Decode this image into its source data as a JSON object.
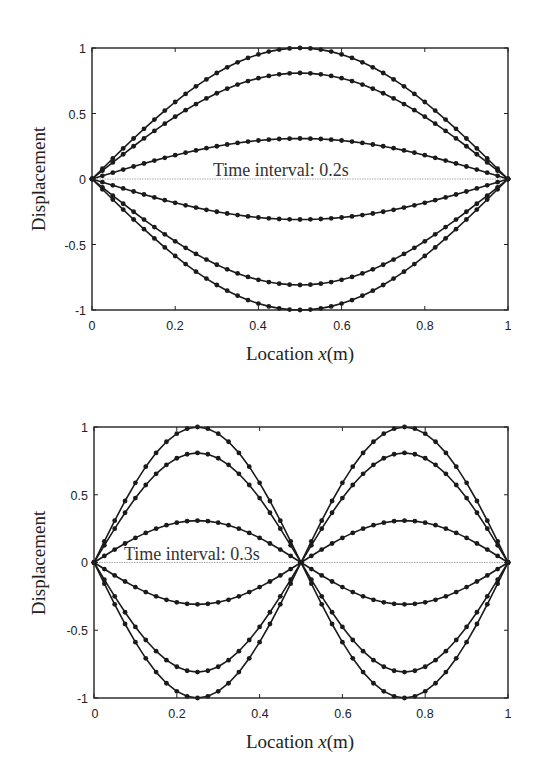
{
  "header_fragment": "...ff...     ...y",
  "chart_data": [
    {
      "type": "line",
      "title": "",
      "annotation": "Time interval: 0.2s",
      "xlabel": "Location x(m)",
      "ylabel": "Displacement",
      "xlim": [
        0,
        1
      ],
      "ylim": [
        -1,
        1
      ],
      "xticks": [
        "0",
        "0.2",
        "0.4",
        "0.6",
        "0.8",
        "1"
      ],
      "yticks": [
        "1",
        "0.5",
        "0",
        "-0.5",
        "-1"
      ],
      "grid": false,
      "mode_shape": "sin(pi*x)",
      "points_per_curve": 41,
      "series": [
        {
          "name": "t0",
          "amplitude": 1.0
        },
        {
          "name": "t1",
          "amplitude": 0.809
        },
        {
          "name": "t2",
          "amplitude": 0.309
        },
        {
          "name": "t3",
          "amplitude": -0.309
        },
        {
          "name": "t4",
          "amplitude": -0.809
        },
        {
          "name": "t5",
          "amplitude": -1.0
        }
      ],
      "zero_line": true
    },
    {
      "type": "line",
      "title": "",
      "annotation": "Time interval: 0.3s",
      "xlabel": "Location x(m)",
      "ylabel": "Displacement",
      "xlim": [
        0,
        1
      ],
      "ylim": [
        -1,
        1
      ],
      "xticks": [
        "0",
        "0.2",
        "0.4",
        "0.6",
        "0.8",
        "1"
      ],
      "yticks": [
        "1",
        "0.5",
        "0",
        "-0.5",
        "-1"
      ],
      "grid": false,
      "mode_shape": "sin(2*pi*x)",
      "points_per_curve": 41,
      "series": [
        {
          "name": "t0",
          "amplitude": 1.0
        },
        {
          "name": "t1",
          "amplitude": 0.809
        },
        {
          "name": "t2",
          "amplitude": 0.309
        },
        {
          "name": "t3",
          "amplitude": -0.309
        },
        {
          "name": "t4",
          "amplitude": -0.809
        },
        {
          "name": "t5",
          "amplitude": -1.0
        }
      ],
      "zero_line": true
    }
  ],
  "plots": [
    {
      "annotation": "Time interval: 0.2s",
      "xlabel_prefix": "Location ",
      "xlabel_var": "x",
      "xlabel_unit": "(m)",
      "ylabel": "Displacement",
      "xticks": [
        "0",
        "0.2",
        "0.4",
        "0.6",
        "0.8",
        "1"
      ],
      "yticks": [
        "1",
        "0.5",
        "0",
        "-0.5",
        "-1"
      ]
    },
    {
      "annotation": "Time interval: 0.3s",
      "xlabel_prefix": "Location ",
      "xlabel_var": "x",
      "xlabel_unit": "(m)",
      "ylabel": "Displacement",
      "xticks": [
        "0",
        "0.2",
        "0.4",
        "0.6",
        "0.8",
        "1"
      ],
      "yticks": [
        "1",
        "0.5",
        "0",
        "-0.5",
        "-1"
      ]
    }
  ],
  "colors": {
    "line": "#1a1a1a",
    "marker": "#1a1a1a",
    "axis": "#222222",
    "zero_line": "#aaaaaa"
  }
}
